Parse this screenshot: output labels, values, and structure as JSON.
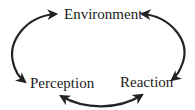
{
  "diagram": {
    "type": "cycle",
    "nodes": [
      {
        "id": "environment",
        "label": "Environment"
      },
      {
        "id": "perception",
        "label": "Perception"
      },
      {
        "id": "reaction",
        "label": "Reaction"
      }
    ],
    "edges": [
      {
        "from": "environment",
        "to": "perception",
        "bidirectional": true
      },
      {
        "from": "environment",
        "to": "reaction",
        "bidirectional": true
      },
      {
        "from": "perception",
        "to": "reaction",
        "bidirectional": true
      }
    ],
    "colors": {
      "stroke": "#222222",
      "text": "#1a1a1a",
      "background": "#ffffff"
    }
  }
}
